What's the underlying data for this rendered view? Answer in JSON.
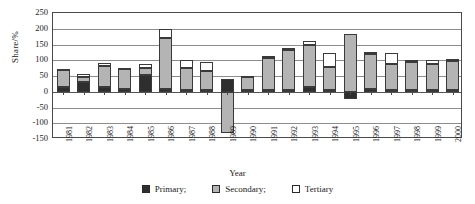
{
  "chart_data": {
    "type": "bar",
    "stacked": true,
    "title": "",
    "xlabel": "Year",
    "ylabel": "Share/%",
    "ylim": [
      -150,
      250
    ],
    "ytick_step": 50,
    "yticks": [
      250,
      200,
      150,
      100,
      50,
      0,
      -50,
      -100,
      -150
    ],
    "ytick_labels": [
      "250",
      "200",
      "150",
      "100",
      "50",
      "0",
      "-50",
      "-100",
      "-150"
    ],
    "grid": true,
    "legend_position": "bottom",
    "categories": [
      "1981",
      "1982",
      "1983",
      "1984",
      "1985",
      "1986",
      "1987",
      "1988",
      "1989",
      "1990",
      "1991",
      "1992",
      "1993",
      "1994",
      "1995",
      "1996",
      "1997",
      "1998",
      "1999",
      "2000"
    ],
    "series": [
      {
        "name": "Primary",
        "color": "#2e2e2e",
        "values": [
          14,
          30,
          16,
          8,
          52,
          10,
          6,
          6,
          42,
          6,
          4,
          4,
          14,
          4,
          -22,
          10,
          6,
          4,
          4,
          4
        ]
      },
      {
        "name": "Secondary",
        "color": "#b4b4b4",
        "values": [
          54,
          18,
          66,
          64,
          24,
          160,
          70,
          60,
          -130,
          40,
          104,
          128,
          134,
          76,
          184,
          110,
          82,
          90,
          84,
          94
        ]
      },
      {
        "name": "Tertiary",
        "color": "#ffffff",
        "values": [
          4,
          8,
          8,
          4,
          12,
          28,
          24,
          28,
          0,
          4,
          6,
          8,
          14,
          44,
          0,
          6,
          34,
          6,
          12,
          6
        ]
      }
    ]
  },
  "legend": {
    "items": [
      {
        "label": "Primary;",
        "swatch": "primary"
      },
      {
        "label": "Secondary;",
        "swatch": "secondary"
      },
      {
        "label": "Tertiary",
        "swatch": "tertiary"
      }
    ]
  }
}
